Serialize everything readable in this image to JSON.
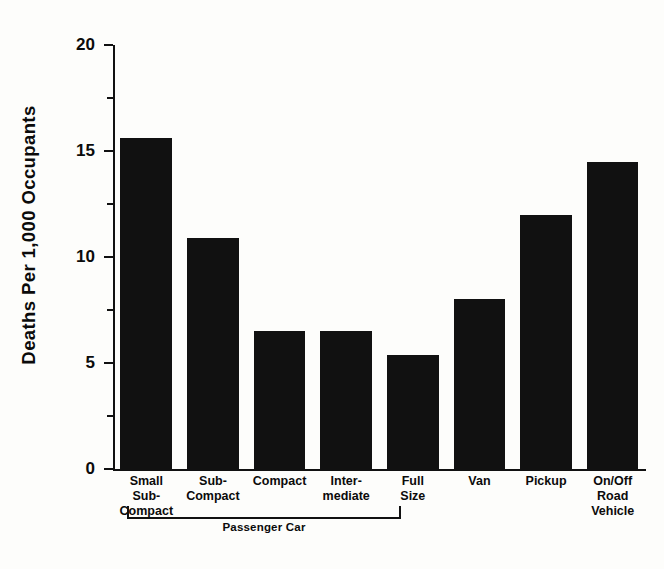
{
  "chart_data": {
    "type": "bar",
    "title": "",
    "xlabel": "",
    "ylabel": "Deaths Per 1,000 Occupants",
    "ylim": [
      0,
      20
    ],
    "ytick_labels": [
      "0",
      "5",
      "10",
      "15",
      "20"
    ],
    "ytick_values": [
      0,
      5,
      10,
      15,
      20
    ],
    "minor_ticks": [
      2.5,
      7.5,
      12.5,
      17.5
    ],
    "grid": false,
    "legend": "none",
    "bar_color": "#111111",
    "categories": [
      "Small Sub-Compact",
      "Sub-Compact",
      "Compact",
      "Inter-mediate",
      "Full Size",
      "Van",
      "Pickup",
      "On/Off Road Vehicle"
    ],
    "category_lines": [
      [
        "Small",
        "Sub-",
        "Compact"
      ],
      [
        "Sub-",
        "Compact"
      ],
      [
        "Compact"
      ],
      [
        "Inter-",
        "mediate"
      ],
      [
        "Full",
        "Size"
      ],
      [
        "Van"
      ],
      [
        "Pickup"
      ],
      [
        "On/Off",
        "Road",
        "Vehicle"
      ]
    ],
    "values": [
      15.6,
      10.9,
      6.5,
      6.5,
      5.4,
      8.0,
      12.0,
      14.5
    ],
    "group_bracket": {
      "label": "Passenger Car",
      "covers": [
        0,
        1,
        2,
        3,
        4
      ]
    }
  },
  "axis": {
    "y_title": "Deaths Per 1,000 Occupants"
  }
}
